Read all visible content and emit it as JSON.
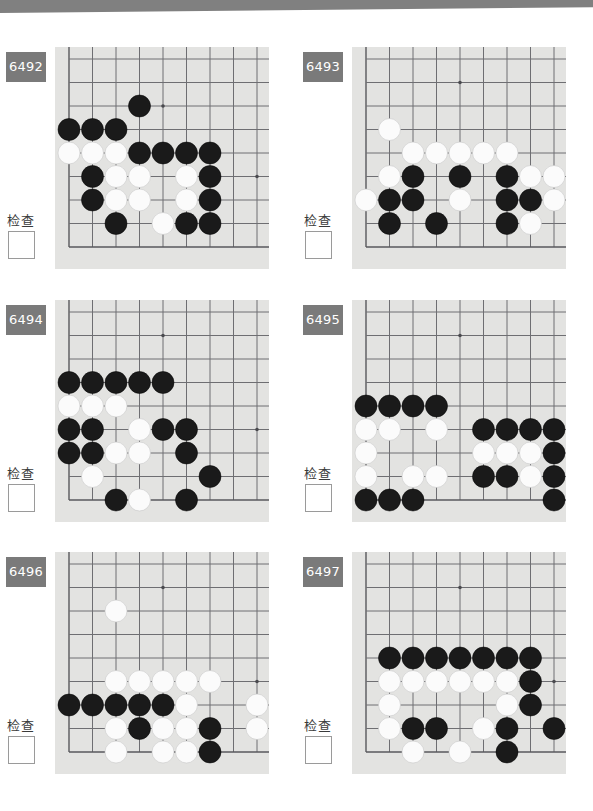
{
  "page": {
    "top_bar_color": "#808080",
    "background_color": "#ffffff",
    "board_color": "#e3e3e1",
    "badge_color": "#7a7a7a",
    "badge_text_color": "#ffffff",
    "grid_color": "#6e6e72",
    "black_stone_color": "#1a1a1a",
    "white_stone_color": "#fbfbfb"
  },
  "labels": {
    "check": "检查"
  },
  "board_geometry": {
    "cols": 9,
    "rows": 9,
    "cell": 23.5,
    "origin_x": 14,
    "origin_y": 12,
    "stone_radius": 11,
    "note": "bottom-left corner board; column 1 and row 9 are the board edges"
  },
  "problems": [
    {
      "id": "6492",
      "number": "6492",
      "position": {
        "left": 0,
        "top": 47
      },
      "star_points": [
        [
          5,
          3
        ],
        [
          9,
          6
        ]
      ],
      "edges": {
        "left_col": 1,
        "bottom_row": 9
      },
      "stones": {
        "black": [
          [
            4,
            3
          ],
          [
            1,
            4
          ],
          [
            2,
            4
          ],
          [
            3,
            4
          ],
          [
            4,
            5
          ],
          [
            5,
            5
          ],
          [
            6,
            5
          ],
          [
            7,
            5
          ],
          [
            2,
            6
          ],
          [
            7,
            6
          ],
          [
            2,
            7
          ],
          [
            7,
            7
          ],
          [
            3,
            8
          ],
          [
            6,
            8
          ],
          [
            7,
            8
          ]
        ],
        "white": [
          [
            1,
            5
          ],
          [
            2,
            5
          ],
          [
            3,
            5
          ],
          [
            3,
            6
          ],
          [
            4,
            6
          ],
          [
            6,
            6
          ],
          [
            3,
            7
          ],
          [
            4,
            7
          ],
          [
            6,
            7
          ],
          [
            5,
            8
          ]
        ]
      }
    },
    {
      "id": "6493",
      "number": "6493",
      "position": {
        "left": 297,
        "top": 47
      },
      "star_points": [
        [
          5,
          2
        ],
        [
          9,
          6
        ]
      ],
      "edges": {
        "left_col": 1,
        "bottom_row": 9
      },
      "stones": {
        "black": [
          [
            3,
            6
          ],
          [
            5,
            6
          ],
          [
            7,
            6
          ],
          [
            2,
            7
          ],
          [
            3,
            7
          ],
          [
            7,
            7
          ],
          [
            8,
            7
          ],
          [
            2,
            8
          ],
          [
            4,
            8
          ],
          [
            7,
            8
          ]
        ],
        "white": [
          [
            2,
            4
          ],
          [
            3,
            5
          ],
          [
            4,
            5
          ],
          [
            5,
            5
          ],
          [
            6,
            5
          ],
          [
            7,
            5
          ],
          [
            2,
            6
          ],
          [
            8,
            6
          ],
          [
            9,
            6
          ],
          [
            1,
            7
          ],
          [
            5,
            7
          ],
          [
            9,
            7
          ],
          [
            8,
            8
          ]
        ]
      }
    },
    {
      "id": "6494",
      "number": "6494",
      "position": {
        "left": 0,
        "top": 300
      },
      "star_points": [
        [
          5,
          2
        ],
        [
          9,
          6
        ]
      ],
      "edges": {
        "left_col": 1,
        "bottom_row": 9
      },
      "stones": {
        "black": [
          [
            1,
            4
          ],
          [
            2,
            4
          ],
          [
            3,
            4
          ],
          [
            4,
            4
          ],
          [
            5,
            4
          ],
          [
            1,
            6
          ],
          [
            2,
            6
          ],
          [
            5,
            6
          ],
          [
            6,
            6
          ],
          [
            1,
            7
          ],
          [
            2,
            7
          ],
          [
            6,
            7
          ],
          [
            7,
            8
          ],
          [
            3,
            9
          ],
          [
            6,
            9
          ]
        ],
        "white": [
          [
            1,
            5
          ],
          [
            2,
            5
          ],
          [
            3,
            5
          ],
          [
            4,
            6
          ],
          [
            3,
            7
          ],
          [
            4,
            7
          ],
          [
            2,
            8
          ],
          [
            4,
            9
          ]
        ]
      }
    },
    {
      "id": "6495",
      "number": "6495",
      "position": {
        "left": 297,
        "top": 300
      },
      "star_points": [
        [
          5,
          2
        ],
        [
          9,
          6
        ]
      ],
      "edges": {
        "left_col": 1,
        "bottom_row": 9
      },
      "stones": {
        "black": [
          [
            1,
            5
          ],
          [
            2,
            5
          ],
          [
            3,
            5
          ],
          [
            4,
            5
          ],
          [
            6,
            6
          ],
          [
            7,
            6
          ],
          [
            8,
            6
          ],
          [
            9,
            6
          ],
          [
            9,
            7
          ],
          [
            6,
            8
          ],
          [
            7,
            8
          ],
          [
            9,
            8
          ],
          [
            1,
            9
          ],
          [
            2,
            9
          ],
          [
            3,
            9
          ],
          [
            9,
            9
          ]
        ],
        "white": [
          [
            1,
            6
          ],
          [
            2,
            6
          ],
          [
            4,
            6
          ],
          [
            1,
            7
          ],
          [
            6,
            7
          ],
          [
            7,
            7
          ],
          [
            8,
            7
          ],
          [
            1,
            8
          ],
          [
            3,
            8
          ],
          [
            4,
            8
          ],
          [
            8,
            8
          ]
        ]
      }
    },
    {
      "id": "6496",
      "number": "6496",
      "position": {
        "left": 0,
        "top": 552
      },
      "star_points": [
        [
          5,
          2
        ],
        [
          9,
          6
        ]
      ],
      "edges": {
        "left_col": 1,
        "bottom_row": 9
      },
      "stones": {
        "black": [
          [
            1,
            7
          ],
          [
            2,
            7
          ],
          [
            3,
            7
          ],
          [
            4,
            7
          ],
          [
            5,
            7
          ],
          [
            4,
            8
          ],
          [
            7,
            8
          ],
          [
            7,
            9
          ]
        ],
        "white": [
          [
            3,
            3
          ],
          [
            3,
            6
          ],
          [
            4,
            6
          ],
          [
            5,
            6
          ],
          [
            6,
            6
          ],
          [
            7,
            6
          ],
          [
            6,
            7
          ],
          [
            9,
            7
          ],
          [
            3,
            8
          ],
          [
            4,
            8,
            "skip"
          ],
          [
            5,
            8
          ],
          [
            6,
            8
          ],
          [
            9,
            8
          ],
          [
            3,
            9
          ],
          [
            5,
            9
          ],
          [
            6,
            9
          ]
        ],
        "white_clean": [
          [
            3,
            3
          ],
          [
            3,
            6
          ],
          [
            4,
            6
          ],
          [
            5,
            6
          ],
          [
            6,
            6
          ],
          [
            7,
            6
          ],
          [
            6,
            7
          ],
          [
            9,
            7
          ],
          [
            3,
            8
          ],
          [
            5,
            8
          ],
          [
            6,
            8
          ],
          [
            9,
            8
          ],
          [
            3,
            9
          ],
          [
            5,
            9
          ],
          [
            6,
            9
          ]
        ]
      }
    },
    {
      "id": "6497",
      "number": "6497",
      "position": {
        "left": 297,
        "top": 552
      },
      "star_points": [
        [
          5,
          2
        ],
        [
          9,
          6
        ]
      ],
      "edges": {
        "left_col": 1,
        "bottom_row": 9
      },
      "stones": {
        "black": [
          [
            2,
            5
          ],
          [
            3,
            5
          ],
          [
            4,
            5
          ],
          [
            5,
            5
          ],
          [
            6,
            5
          ],
          [
            7,
            5
          ],
          [
            8,
            5
          ],
          [
            8,
            6
          ],
          [
            8,
            7
          ],
          [
            3,
            8
          ],
          [
            4,
            8
          ],
          [
            7,
            8
          ],
          [
            9,
            8
          ],
          [
            7,
            9
          ]
        ],
        "white": [
          [
            2,
            6
          ],
          [
            3,
            6
          ],
          [
            4,
            6
          ],
          [
            5,
            6
          ],
          [
            6,
            6
          ],
          [
            7,
            6
          ],
          [
            2,
            7
          ],
          [
            7,
            7
          ],
          [
            2,
            8
          ],
          [
            6,
            8
          ],
          [
            3,
            9
          ],
          [
            5,
            9
          ]
        ]
      }
    }
  ]
}
